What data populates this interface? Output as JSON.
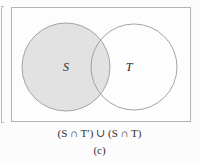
{
  "figure": {
    "type": "venn-diagram",
    "universe_label": "",
    "sets": [
      {
        "id": "S",
        "label": "S",
        "shaded": true,
        "fill_color": "#e2e2e2",
        "stroke_color": "#9a9a9a",
        "center": {
          "x": 55,
          "y": 60
        },
        "radius": 44
      },
      {
        "id": "T",
        "label": "T",
        "shaded": false,
        "fill_color": "#ffffff",
        "stroke_color": "#9a9a9a",
        "center": {
          "x": 123,
          "y": 60
        },
        "radius": 43
      }
    ],
    "shaded_region_description": "entire set S including the intersection with T",
    "frame_stroke_color": "#b3b3b3",
    "background_color": "#fcfcfc"
  },
  "caption": {
    "expression": "(S ∩ T′) ∪ (S ∩ T)",
    "index": "(c)"
  }
}
